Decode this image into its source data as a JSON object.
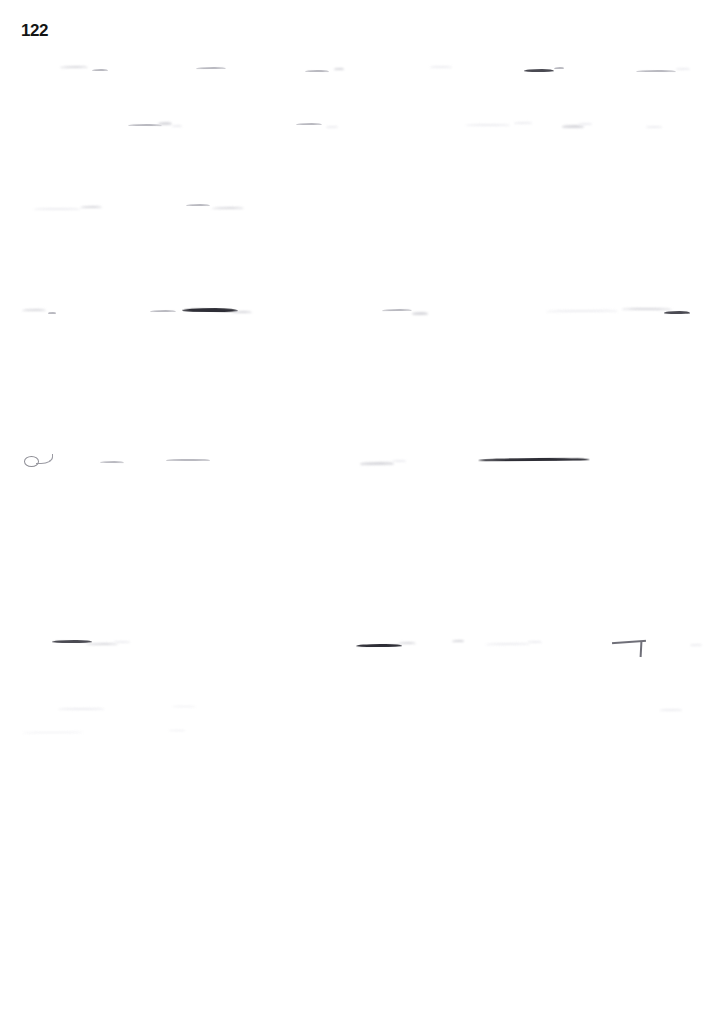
{
  "document": {
    "page_number": "122",
    "page_width": 725,
    "page_height": 1032,
    "background_color": "#ffffff",
    "ink_color": "#2e2e36",
    "condition": "severely faded scan; body text illegible",
    "legible_text": [
      "122"
    ]
  },
  "page_number_label": "122",
  "content": {
    "note": "All body text on this page is degraded beyond legibility. Only faint horizontal ink remnants of text lines remain; no words are readable.",
    "readable_text_count": 1,
    "text_line_rows": [
      {
        "id": "line-1",
        "top": 60,
        "marks": [
          {
            "left": 60,
            "width": 28,
            "height": 2.0,
            "tone": "faint"
          },
          {
            "left": 92,
            "width": 16,
            "height": 2.2,
            "tone": "wisp"
          },
          {
            "left": 196,
            "width": 30,
            "height": 2.0,
            "tone": "wisp"
          },
          {
            "left": 305,
            "width": 24,
            "height": 2.4,
            "tone": "wisp"
          },
          {
            "left": 334,
            "width": 10,
            "height": 1.8,
            "tone": "faint"
          },
          {
            "left": 430,
            "width": 22,
            "height": 1.8,
            "tone": "ghost"
          },
          {
            "left": 524,
            "width": 30,
            "height": 3.0,
            "tone": "dark"
          },
          {
            "left": 554,
            "width": 10,
            "height": 2.0,
            "tone": "wisp"
          },
          {
            "left": 636,
            "width": 40,
            "height": 2.2,
            "tone": "wisp"
          },
          {
            "left": 676,
            "width": 14,
            "height": 1.6,
            "tone": "ghost"
          }
        ]
      },
      {
        "id": "line-2",
        "top": 116,
        "marks": [
          {
            "left": 128,
            "width": 34,
            "height": 2.2,
            "tone": "wisp"
          },
          {
            "left": 158,
            "width": 14,
            "height": 2.8,
            "tone": "faint"
          },
          {
            "left": 172,
            "width": 10,
            "height": 1.8,
            "tone": "ghost"
          },
          {
            "left": 296,
            "width": 26,
            "height": 2.0,
            "tone": "wisp"
          },
          {
            "left": 326,
            "width": 12,
            "height": 1.6,
            "tone": "ghost"
          },
          {
            "left": 466,
            "width": 44,
            "height": 1.8,
            "tone": "ghost"
          },
          {
            "left": 514,
            "width": 18,
            "height": 1.6,
            "tone": "ghost"
          },
          {
            "left": 562,
            "width": 22,
            "height": 2.6,
            "tone": "faint"
          },
          {
            "left": 578,
            "width": 14,
            "height": 1.8,
            "tone": "ghost"
          },
          {
            "left": 646,
            "width": 16,
            "height": 1.6,
            "tone": "ghost"
          }
        ]
      },
      {
        "id": "line-3",
        "top": 198,
        "marks": [
          {
            "left": 34,
            "width": 46,
            "height": 1.8,
            "tone": "ghost"
          },
          {
            "left": 80,
            "width": 22,
            "height": 2.2,
            "tone": "faint"
          },
          {
            "left": 186,
            "width": 24,
            "height": 2.0,
            "tone": "wisp"
          },
          {
            "left": 212,
            "width": 32,
            "height": 2.0,
            "tone": "faint"
          }
        ]
      },
      {
        "id": "line-4",
        "top": 302,
        "marks": [
          {
            "left": 22,
            "width": 24,
            "height": 2.4,
            "tone": "faint"
          },
          {
            "left": 48,
            "width": 8,
            "height": 2.0,
            "tone": "wisp"
          },
          {
            "left": 150,
            "width": 26,
            "height": 2.0,
            "tone": "wisp"
          },
          {
            "left": 182,
            "width": 56,
            "height": 4.0,
            "tone": "inky"
          },
          {
            "left": 232,
            "width": 20,
            "height": 2.2,
            "tone": "faint"
          },
          {
            "left": 382,
            "width": 30,
            "height": 2.0,
            "tone": "wisp"
          },
          {
            "left": 412,
            "width": 16,
            "height": 2.6,
            "tone": "faint"
          },
          {
            "left": 546,
            "width": 72,
            "height": 1.8,
            "tone": "ghost"
          },
          {
            "left": 622,
            "width": 50,
            "height": 2.4,
            "tone": "faint"
          },
          {
            "left": 664,
            "width": 26,
            "height": 2.8,
            "tone": "dark"
          }
        ]
      },
      {
        "id": "line-5",
        "top": 452,
        "marks": [
          {
            "left": 100,
            "width": 24,
            "height": 2.0,
            "tone": "wisp"
          },
          {
            "left": 166,
            "width": 44,
            "height": 1.8,
            "tone": "wisp"
          },
          {
            "left": 360,
            "width": 34,
            "height": 2.6,
            "tone": "faint"
          },
          {
            "left": 392,
            "width": 14,
            "height": 1.8,
            "tone": "ghost"
          },
          {
            "left": 478,
            "width": 112,
            "height": 3.2,
            "tone": "inky"
          }
        ],
        "has_loop_glyph": true
      },
      {
        "id": "line-6",
        "top": 634,
        "marks": [
          {
            "left": 52,
            "width": 40,
            "height": 3.2,
            "tone": "dark"
          },
          {
            "left": 86,
            "width": 32,
            "height": 2.0,
            "tone": "faint"
          },
          {
            "left": 114,
            "width": 16,
            "height": 1.6,
            "tone": "ghost"
          },
          {
            "left": 356,
            "width": 46,
            "height": 3.4,
            "tone": "inky"
          },
          {
            "left": 398,
            "width": 18,
            "height": 2.0,
            "tone": "faint"
          },
          {
            "left": 452,
            "width": 12,
            "height": 2.4,
            "tone": "faint"
          },
          {
            "left": 486,
            "width": 44,
            "height": 1.8,
            "tone": "ghost"
          },
          {
            "left": 528,
            "width": 14,
            "height": 1.6,
            "tone": "ghost"
          },
          {
            "left": 690,
            "width": 12,
            "height": 1.6,
            "tone": "ghost"
          }
        ],
        "has_angular_mark": true
      },
      {
        "id": "line-7",
        "top": 700,
        "marks": [
          {
            "left": 58,
            "width": 46,
            "height": 1.6,
            "tone": "ghost"
          },
          {
            "left": 172,
            "width": 24,
            "height": 1.4,
            "tone": "ghost"
          },
          {
            "left": 660,
            "width": 22,
            "height": 1.6,
            "tone": "ghost"
          }
        ]
      },
      {
        "id": "line-8",
        "top": 722,
        "marks": [
          {
            "left": 22,
            "width": 62,
            "height": 1.4,
            "tone": "ghost"
          },
          {
            "left": 168,
            "width": 18,
            "height": 1.2,
            "tone": "ghost"
          }
        ]
      }
    ]
  }
}
